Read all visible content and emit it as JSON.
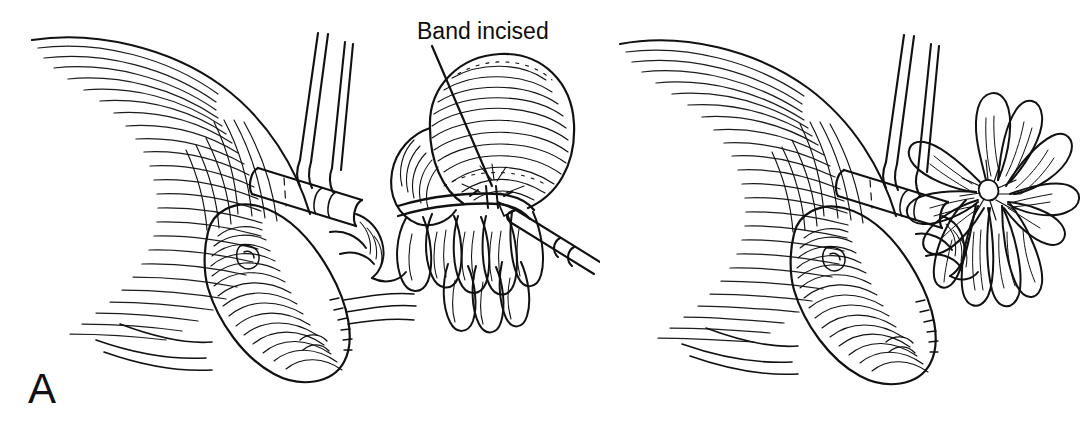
{
  "figure": {
    "type": "medical-surgical-line-illustration",
    "style": "pen-and-ink hatched line drawing, black on white",
    "width_px": 1088,
    "height_px": 438,
    "background_color": "#ffffff",
    "ink_color": "#111111",
    "artist_signature": "D.Abeloff",
    "panel_count": 2
  },
  "annotations": {
    "band_incised_label": "Band incised"
  },
  "panels": [
    {
      "id": "A",
      "label": "A",
      "caption": "Band incised",
      "description": "Operative view showing a tubular cannula with retractor held across hatched tissue; a scalpel incises the constricting band over the rounded distal mass, with finger-like lobes splayed beneath.",
      "elements": [
        "hatched-tissue-flap",
        "cannula-tube",
        "retractor-handles",
        "banded-round-mass",
        "constricting-band",
        "scalpel",
        "lobule-cluster",
        "lower-organ-mass"
      ]
    },
    {
      "id": "B",
      "label": "B",
      "caption": "",
      "description": "Same operative field after the band has been divided; the lobes have fanned out into a radiating rosette arrangement.",
      "elements": [
        "hatched-tissue-flap",
        "cannula-tube",
        "retractor-handles",
        "rosette-lobe-fan",
        "lower-organ-mass",
        "artist-signature"
      ]
    }
  ]
}
